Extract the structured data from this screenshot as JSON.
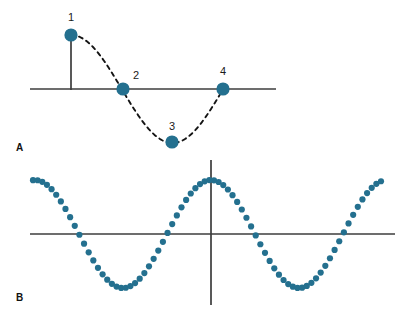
{
  "figure": {
    "width": 404,
    "height": 316,
    "background_color": "#ffffff",
    "marker_color": "#24708f",
    "axis_color": "#3c3c3c",
    "curve_color": "#141414",
    "label_color": "#1a1a1a"
  },
  "panel_a": {
    "letter": "A",
    "letter_x": 16,
    "letter_y": 151,
    "axis": {
      "horizontal": {
        "x1": 30,
        "y1": 89,
        "x2": 276,
        "y2": 89
      },
      "vertical_tick": {
        "x1": 71,
        "y1": 35,
        "x2": 71,
        "y2": 90
      }
    },
    "curve": {
      "type": "dashed-sine",
      "x_start": 71,
      "x_end": 223,
      "baseline_y": 89,
      "amplitude": 54,
      "period": 203,
      "phase": "cosine-start-at-peak"
    },
    "points": [
      {
        "label": "1",
        "x": 71,
        "y": 35,
        "r": 6.6,
        "label_x": 71,
        "label_y": 21
      },
      {
        "label": "2",
        "x": 123,
        "y": 89,
        "r": 6.6,
        "label_x": 136,
        "label_y": 79
      },
      {
        "label": "3",
        "x": 172,
        "y": 142,
        "r": 6.6,
        "label_x": 172,
        "label_y": 130
      },
      {
        "label": "4",
        "x": 223,
        "y": 89,
        "r": 6.6,
        "label_x": 223,
        "label_y": 75
      }
    ]
  },
  "panel_b": {
    "letter": "B",
    "letter_x": 16,
    "letter_y": 301,
    "axis": {
      "horizontal": {
        "x1": 30,
        "y1": 234,
        "x2": 395,
        "y2": 234
      },
      "vertical": {
        "x1": 211,
        "y1": 160,
        "x2": 211,
        "y2": 305
      }
    },
    "wave": {
      "type": "dotted-cosine",
      "x_start": 33,
      "x_end": 381,
      "baseline_y": 234,
      "amplitude": 54,
      "period": 176,
      "peak_x": 211,
      "dot_radius": 3.1,
      "dot_count": 76,
      "zero_crossings_x": [
        80,
        168,
        256,
        344
      ],
      "peaks_x": [
        35,
        211,
        387
      ],
      "troughs_x": [
        123,
        299
      ]
    }
  },
  "chart_data": {
    "type": "line",
    "title": "",
    "xlabel": "",
    "ylabel": "",
    "panels": [
      {
        "name": "A",
        "description": "One cycle of a sine/cosine wave drawn as a dashed curve with four labelled phase points",
        "series": [
          {
            "name": "dashed sine cycle",
            "points": [
              {
                "label": "1",
                "x": 0,
                "y": 1,
                "phase_deg": 0
              },
              {
                "label": "2",
                "x": 0.25,
                "y": 0,
                "phase_deg": 90
              },
              {
                "label": "3",
                "x": 0.5,
                "y": -1,
                "phase_deg": 180
              },
              {
                "label": "4",
                "x": 0.75,
                "y": 0,
                "phase_deg": 270
              }
            ]
          }
        ],
        "ylim": [
          -1,
          1
        ],
        "grid": false,
        "legend": "none"
      },
      {
        "name": "B",
        "description": "Continuous dotted cosine wave spanning about two cycles, plotted on x and y axes crossing at the origin",
        "series": [
          {
            "name": "dotted cosine",
            "amplitude": 1,
            "cycles": 2.0,
            "phase_deg": 0
          }
        ],
        "ylim": [
          -1,
          1
        ],
        "xlim": [
          -1.01,
          0.97
        ],
        "grid": false,
        "legend": "none"
      }
    ]
  }
}
